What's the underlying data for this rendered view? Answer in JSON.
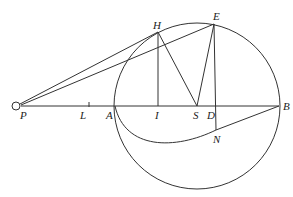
{
  "diagram": {
    "type": "geometric-construction",
    "points": {
      "P": {
        "label": "P",
        "x": 17,
        "y": 106
      },
      "L": {
        "label": "L",
        "x": 89,
        "y": 106
      },
      "A": {
        "label": "A",
        "x": 115,
        "y": 106
      },
      "I": {
        "label": "I",
        "x": 158,
        "y": 106
      },
      "S": {
        "label": "S",
        "x": 197,
        "y": 106
      },
      "D": {
        "label": "D",
        "x": 216,
        "y": 106
      },
      "B": {
        "label": "B",
        "x": 279,
        "y": 106
      },
      "H": {
        "label": "H",
        "x": 158,
        "y": 32
      },
      "E": {
        "label": "E",
        "x": 214,
        "y": 24
      },
      "N": {
        "label": "N",
        "x": 216,
        "y": 130
      }
    },
    "circle": {
      "cx": 197,
      "cy": 106,
      "r": 83
    },
    "segments": [
      "PB",
      "PH",
      "PE",
      "HI",
      "HS",
      "SE",
      "ED",
      "DN"
    ],
    "curves": [
      "A-N-B arc"
    ],
    "colors": {
      "stroke": "#333333",
      "background": "#ffffff"
    }
  }
}
